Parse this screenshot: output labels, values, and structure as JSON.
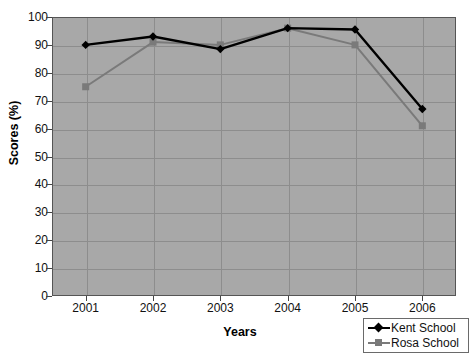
{
  "chart_data": {
    "type": "line",
    "title": "",
    "xlabel": "Years",
    "ylabel": "Scores (%)",
    "categories": [
      "2001",
      "2002",
      "2003",
      "2004",
      "2005",
      "2006"
    ],
    "x": [
      2001,
      2002,
      2003,
      2004,
      2005,
      2006
    ],
    "ylim": [
      0,
      100
    ],
    "ytick_step": 10,
    "yticks": [
      0,
      10,
      20,
      30,
      40,
      50,
      60,
      70,
      80,
      90,
      100
    ],
    "grid": true,
    "legend_position": "bottom-right",
    "plot_background": "#a8a8a8",
    "series": [
      {
        "name": "Kent School",
        "color": "#000000",
        "marker": "diamond",
        "values": [
          90,
          93,
          88.5,
          96,
          95.5,
          67
        ]
      },
      {
        "name": "Rosa School",
        "color": "#7a7a7a",
        "marker": "square",
        "values": [
          75,
          91,
          90,
          96,
          90,
          61
        ]
      }
    ]
  },
  "axes": {
    "y_title": "Scores (%)",
    "x_title": "Years",
    "y_tick_labels": [
      "100",
      "90",
      "80",
      "70",
      "60",
      "50",
      "40",
      "30",
      "20",
      "10",
      "0"
    ],
    "x_tick_labels": [
      "2001",
      "2002",
      "2003",
      "2004",
      "2005",
      "2006"
    ]
  },
  "legend": {
    "items": [
      {
        "label": "Kent School",
        "color": "#000000",
        "marker": "diamond-icon"
      },
      {
        "label": "Rosa School",
        "color": "#7a7a7a",
        "marker": "square-icon"
      }
    ]
  }
}
